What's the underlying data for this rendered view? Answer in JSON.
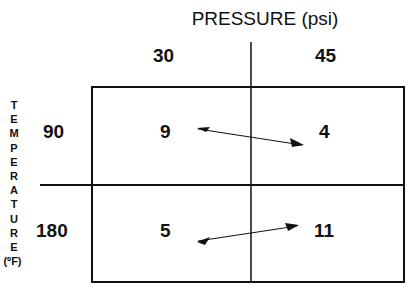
{
  "diagram": {
    "column_axis_title": "PRESSURE (psi)",
    "row_axis_title_letters": [
      "T",
      "E",
      "M",
      "P",
      "E",
      "R",
      "A",
      "T",
      "U",
      "R",
      "E",
      "(ºF)"
    ],
    "columns": [
      "30",
      "45"
    ],
    "rows": [
      "90",
      "180"
    ],
    "cells": [
      [
        "9",
        "4"
      ],
      [
        "5",
        "11"
      ]
    ],
    "arrows": [
      {
        "from": "9",
        "to": "4",
        "direction": "down-right"
      },
      {
        "from": "5",
        "to": "11",
        "direction": "up-right"
      }
    ]
  }
}
